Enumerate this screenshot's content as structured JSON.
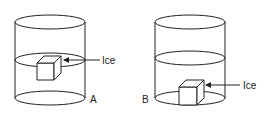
{
  "diagram": {
    "cylinders": [
      {
        "id": "A",
        "label": "A",
        "ice_label": "Ice",
        "ice_position": "floating at water surface"
      },
      {
        "id": "B",
        "label": "B",
        "ice_label": "Ice",
        "ice_position": "resting at bottom"
      }
    ],
    "colors": {
      "line": "#222222",
      "background": "#ffffff"
    }
  }
}
